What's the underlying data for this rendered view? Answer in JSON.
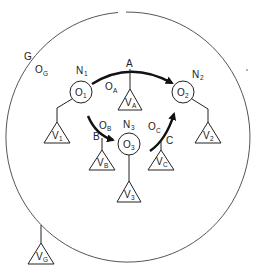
{
  "diagram": {
    "type": "object-graph",
    "colors": {
      "line": "#222222",
      "arrow": "#111111",
      "background": "#ffffff",
      "outer_circle": "#555555"
    },
    "outer_group": {
      "label": "G",
      "object_label": "O",
      "object_sub": "G",
      "variable_label": "V",
      "variable_sub": "G"
    },
    "nodes": [
      {
        "id": "N1",
        "name": "N",
        "name_sub": "1",
        "object": "O",
        "object_sub": "1",
        "variable": "V",
        "variable_sub": "1"
      },
      {
        "id": "N2",
        "name": "N",
        "name_sub": "2",
        "object": "O",
        "object_sub": "2",
        "variable": "V",
        "variable_sub": "2"
      },
      {
        "id": "N3",
        "name": "N",
        "name_sub": "3",
        "object": "O",
        "object_sub": "3",
        "variable": "V",
        "variable_sub": "3"
      }
    ],
    "edges": [
      {
        "id": "A",
        "label": "A",
        "from": "N1",
        "to": "N2",
        "object": "O",
        "object_sub": "A",
        "variable": "V",
        "variable_sub": "A"
      },
      {
        "id": "B",
        "label": "B",
        "from": "N1",
        "to": "N3",
        "object": "O",
        "object_sub": "B",
        "variable": "V",
        "variable_sub": "B"
      },
      {
        "id": "C",
        "label": "C",
        "from": "N3",
        "to": "N2",
        "object": "O",
        "object_sub": "C",
        "variable": "V",
        "variable_sub": "C"
      }
    ]
  }
}
